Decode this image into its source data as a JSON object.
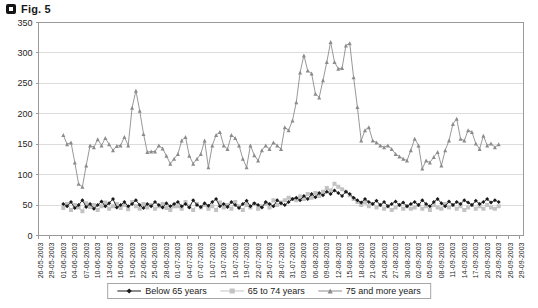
{
  "figure": {
    "label": "Fig. 5"
  },
  "chart_data": {
    "type": "line",
    "title": "Fig. 5",
    "grid": "horizontal",
    "legend_position": "bottom",
    "colors": {
      "grid": "#dcdcdc",
      "axis": "#9a9a9a",
      "text": "#262626"
    },
    "y_axis": {
      "min": 0,
      "max": 350,
      "tick_step": 50,
      "ticks": [
        0,
        50,
        100,
        150,
        200,
        250,
        300,
        350
      ]
    },
    "x_axis": {
      "tick_interval_days": 3,
      "total_days": 127,
      "data_start_label": "01-06-2003",
      "data_end_label": "23-09-2003",
      "data_start_day_offset": 6,
      "tick_labels": [
        "26-05-2003",
        "29-05-2003",
        "01-06-2003",
        "04-06-2003",
        "07-06-2003",
        "10-06-2003",
        "13-06-2003",
        "16-06-2003",
        "19-06-2003",
        "22-06-2003",
        "25-06-2003",
        "28-06-2003",
        "01-07-2003",
        "04-07-2003",
        "07-07-2003",
        "10-07-2003",
        "13-07-2003",
        "16-07-2003",
        "19-07-2003",
        "22-07-2003",
        "25-07-2003",
        "28-07-2003",
        "31-07-2003",
        "03-08-2003",
        "06-08-2003",
        "09-08-2003",
        "12-08-2003",
        "15-08-2003",
        "18-08-2003",
        "21-08-2003",
        "24-08-2003",
        "27-08-2003",
        "30-08-2003",
        "02-09-2003",
        "05-09-2003",
        "08-09-2003",
        "11-09-2003",
        "14-09-2003",
        "17-09-2003",
        "20-09-2003",
        "23-09-2003",
        "26-09-2003",
        "29-09-2003"
      ]
    },
    "series": [
      {
        "name": "Below 65 years",
        "marker": "diamond",
        "color": "#1a1a1a",
        "values": [
          52,
          48,
          55,
          45,
          50,
          58,
          47,
          52,
          44,
          50,
          56,
          48,
          53,
          60,
          46,
          50,
          55,
          48,
          52,
          58,
          50,
          45,
          52,
          48,
          55,
          50,
          46,
          53,
          48,
          52,
          55,
          48,
          52,
          46,
          58,
          50,
          47,
          53,
          49,
          55,
          60,
          48,
          52,
          47,
          55,
          50,
          45,
          52,
          57,
          48,
          53,
          50,
          46,
          55,
          52,
          48,
          58,
          53,
          50,
          55,
          60,
          62,
          58,
          65,
          60,
          68,
          63,
          70,
          66,
          72,
          68,
          74,
          70,
          65,
          72,
          68,
          62,
          58,
          54,
          60,
          55,
          52,
          57,
          50,
          55,
          48,
          52,
          56,
          50,
          54,
          48,
          52,
          55,
          50,
          58,
          52,
          48,
          55,
          60,
          53,
          48,
          56,
          50,
          55,
          52,
          58,
          54,
          50,
          57,
          52,
          55,
          60,
          54,
          58,
          55
        ]
      },
      {
        "name": "65 to 74 years",
        "marker": "square",
        "color": "#c3c3c3",
        "values": [
          45,
          52,
          42,
          50,
          46,
          40,
          53,
          47,
          50,
          42,
          48,
          54,
          44,
          48,
          52,
          45,
          50,
          43,
          55,
          48,
          44,
          52,
          46,
          50,
          44,
          48,
          52,
          45,
          42,
          48,
          48,
          44,
          55,
          48,
          42,
          52,
          46,
          50,
          44,
          48,
          42,
          54,
          46,
          50,
          44,
          55,
          48,
          42,
          50,
          46,
          52,
          44,
          48,
          52,
          46,
          58,
          50,
          54,
          58,
          62,
          60,
          58,
          64,
          60,
          68,
          62,
          70,
          65,
          72,
          78,
          74,
          85,
          80,
          76,
          72,
          66,
          60,
          55,
          50,
          54,
          48,
          52,
          46,
          50,
          44,
          48,
          42,
          46,
          50,
          44,
          48,
          44,
          46,
          50,
          44,
          48,
          42,
          50,
          46,
          44,
          52,
          46,
          50,
          44,
          48,
          42,
          46,
          50,
          44,
          48,
          44,
          50,
          46,
          44,
          48
        ]
      },
      {
        "name": "75 and more years",
        "marker": "triangle",
        "color": "#8c8c8c",
        "values": [
          165,
          150,
          153,
          120,
          85,
          80,
          115,
          148,
          145,
          158,
          148,
          160,
          150,
          140,
          147,
          148,
          162,
          148,
          210,
          238,
          205,
          167,
          137,
          138,
          138,
          148,
          143,
          131,
          118,
          126,
          134,
          156,
          162,
          131,
          118,
          126,
          134,
          156,
          112,
          148,
          165,
          170,
          148,
          142,
          165,
          160,
          148,
          126,
          112,
          148,
          132,
          123,
          140,
          148,
          142,
          153,
          148,
          142,
          178,
          173,
          189,
          219,
          268,
          296,
          271,
          266,
          233,
          227,
          255,
          285,
          318,
          285,
          274,
          275,
          312,
          316,
          260,
          211,
          156,
          173,
          178,
          156,
          153,
          148,
          145,
          148,
          142,
          134,
          130,
          126,
          123,
          140,
          159,
          148,
          110,
          123,
          120,
          129,
          137,
          115,
          140,
          156,
          183,
          192,
          159,
          156,
          173,
          170,
          151,
          142,
          164,
          148,
          151,
          145,
          150
        ]
      }
    ]
  }
}
